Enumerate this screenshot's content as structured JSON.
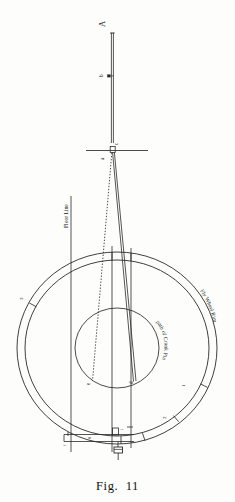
{
  "figure": {
    "caption": "Fig.  11",
    "title_implicit": "Fly Wheel Rim and Crank Pin Path Diagram"
  },
  "labels": {
    "rod_top": "A",
    "rod_mark_b": "b",
    "crosshead_c": "c",
    "crosshead_a": "a",
    "inner_left": "e",
    "inner_right": "d",
    "bottom_center": "f",
    "bottom_left": "f",
    "bottom_mid": "g",
    "bottom_right": "i"
  },
  "annotations": {
    "floor_line": "Floor Line",
    "fly_wheel_rim": "Fly Wheel Rim",
    "crank_path": "path of Crank Pin"
  },
  "rim_ticks": [
    {
      "id": "tick-1",
      "number": "1",
      "angle_deg": 208
    },
    {
      "id": "tick-2",
      "number": "2",
      "angle_deg": 25
    },
    {
      "id": "tick-3",
      "number": "3",
      "angle_deg": 52
    },
    {
      "id": "tick-4",
      "number": "4",
      "angle_deg": 75
    },
    {
      "id": "tick-5",
      "number": "5",
      "angle_deg": 270
    }
  ],
  "geometry": {
    "wheel_center_x": 117,
    "wheel_center_y": 348,
    "outer_radius": 100,
    "rim_inner_radius": 92,
    "crank_circle_radius": 42,
    "rod_top_x": 112,
    "rod_top_y": 30,
    "crosshead_y": 143
  },
  "colors": {
    "ink": "#1b1b1b",
    "line": "#2a2a2a",
    "paper": "#fdfdfc",
    "faint": "#555555"
  }
}
